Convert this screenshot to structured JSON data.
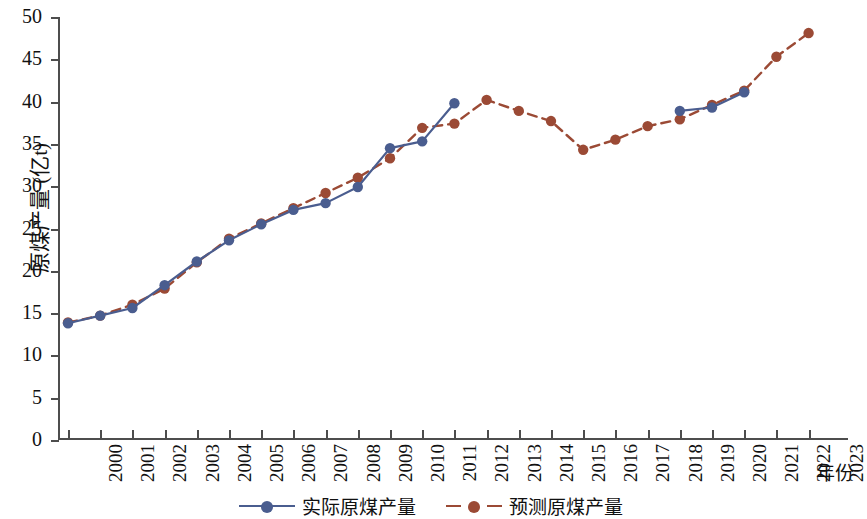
{
  "chart_data": {
    "type": "line",
    "title": "",
    "xlabel": "年份",
    "ylabel": "原煤产量 (亿t)",
    "ylim": [
      0,
      50
    ],
    "yticks": [
      0,
      5,
      10,
      15,
      20,
      25,
      30,
      35,
      40,
      45,
      50
    ],
    "grid": false,
    "legend_position": "bottom-center",
    "x": [
      "2000",
      "2001",
      "2002",
      "2003",
      "2004",
      "2005",
      "2006",
      "2007",
      "2008",
      "2009",
      "2010",
      "2011",
      "2012",
      "2013",
      "2014",
      "2015",
      "2016",
      "2017",
      "2018",
      "2019",
      "2020",
      "2021",
      "2022",
      "2023"
    ],
    "series": [
      {
        "name": "实际原煤产量",
        "style": "solid",
        "color": "#4a5d8f",
        "marker": "circle",
        "marker_color": "#4a5d8f",
        "values": [
          13.8,
          14.7,
          15.6,
          18.3,
          21.1,
          23.6,
          25.5,
          27.2,
          28.0,
          29.9,
          34.5,
          35.3,
          39.8,
          null,
          null,
          null,
          null,
          null,
          null,
          38.9,
          39.3,
          41.1,
          null,
          null
        ]
      },
      {
        "name": "预测原煤产量",
        "style": "dashed",
        "color": "#9b4a35",
        "marker": "circle",
        "marker_color": "#9b4a35",
        "values": [
          13.9,
          14.7,
          16.0,
          17.9,
          21.0,
          23.8,
          25.6,
          27.4,
          29.2,
          31.0,
          33.3,
          36.9,
          37.4,
          40.2,
          38.9,
          37.7,
          34.3,
          35.5,
          37.1,
          37.9,
          39.6,
          41.3,
          45.3,
          48.1
        ]
      }
    ],
    "colors": {
      "actual": "#4a5d8f",
      "predicted": "#9b4a35",
      "axis": "#4d4d4d",
      "background": "#ffffff"
    }
  },
  "legend": {
    "entries": [
      {
        "label": "实际原煤产量"
      },
      {
        "label": "预测原煤产量"
      }
    ]
  }
}
